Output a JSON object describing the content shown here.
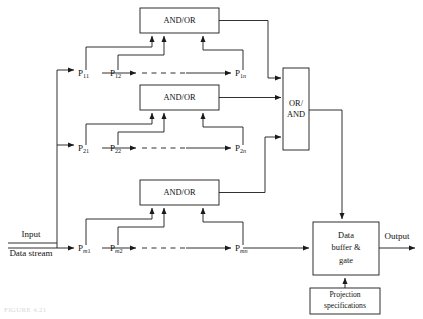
{
  "figure": {
    "caption": "FIGURE 4.21",
    "background_color": "#ffffff",
    "line_color": "#1a1a1a",
    "text_color": "#111111"
  },
  "inputs": {
    "input_label": "Input",
    "data_stream_label": "Data stream"
  },
  "outputs": {
    "output_label": "Output"
  },
  "logic_boxes": [
    {
      "id": "and-or-1",
      "label": "AND/OR"
    },
    {
      "id": "and-or-2",
      "label": "AND/OR"
    },
    {
      "id": "and-or-3",
      "label": "AND/OR"
    }
  ],
  "combiner_box": {
    "id": "or-and",
    "line1": "OR/",
    "line2": "AND"
  },
  "buffer_box": {
    "id": "data-buffer-gate",
    "line1": "Data",
    "line2": "buffer &",
    "line3": "gate"
  },
  "projection_box": {
    "id": "projection-specifications",
    "line1": "Projection",
    "line2": "specifications"
  },
  "processor_rows": [
    {
      "row_id": "row-1",
      "row_index": "1",
      "nodes": [
        {
          "id": "p-11",
          "base": "P",
          "sub_row": "1",
          "sub_col": "1",
          "sub_col_italic": false
        },
        {
          "id": "p-12",
          "base": "P",
          "sub_row": "1",
          "sub_col": "2",
          "sub_col_italic": false
        },
        {
          "id": "p-1n",
          "base": "P",
          "sub_row": "1",
          "sub_col": "n",
          "sub_col_italic": true
        }
      ]
    },
    {
      "row_id": "row-2",
      "row_index": "2",
      "nodes": [
        {
          "id": "p-21",
          "base": "P",
          "sub_row": "2",
          "sub_col": "1",
          "sub_col_italic": false
        },
        {
          "id": "p-22",
          "base": "P",
          "sub_row": "2",
          "sub_col": "2",
          "sub_col_italic": false
        },
        {
          "id": "p-2n",
          "base": "P",
          "sub_row": "2",
          "sub_col": "n",
          "sub_col_italic": true
        }
      ]
    },
    {
      "row_id": "row-m",
      "row_index": "m",
      "nodes": [
        {
          "id": "p-m1",
          "base": "P",
          "sub_row": "m",
          "sub_col": "1",
          "sub_col_italic": false
        },
        {
          "id": "p-m2",
          "base": "P",
          "sub_row": "m",
          "sub_col": "2",
          "sub_col_italic": false
        },
        {
          "id": "p-mn",
          "base": "P",
          "sub_row": "m",
          "sub_col": "n",
          "sub_col_italic": true
        }
      ]
    }
  ]
}
